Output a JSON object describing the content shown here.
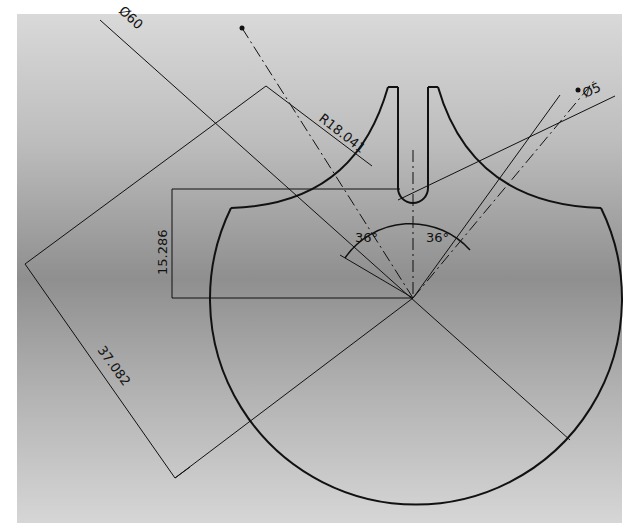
{
  "drawing": {
    "title": "Circular plate with slot and cutout arcs",
    "dimensions": {
      "outer_diameter": "Ø60",
      "slot_diameter": "Ø5",
      "arc_radius": "R18.041",
      "vertical_offset": "15.286",
      "diagonal_length": "37.082",
      "angle_left": "36°",
      "angle_right": "36°"
    },
    "colors": {
      "line": "#111111",
      "background_top": "#d9d9d9",
      "background_mid": "#8f8f8f",
      "margin": "#ffffff"
    }
  }
}
